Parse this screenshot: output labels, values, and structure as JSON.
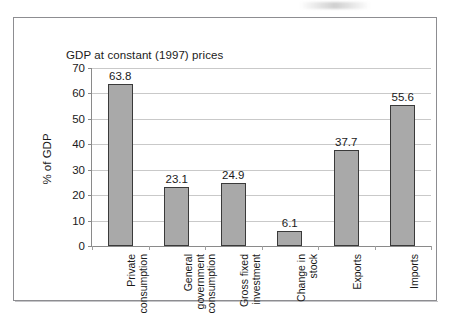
{
  "chart_data": {
    "type": "bar",
    "title": "GDP at constant (1997) prices",
    "xlabel": "",
    "ylabel": "% of GDP",
    "ylim": [
      0,
      70
    ],
    "ytick_step": 10,
    "yticks": [
      "70",
      "60",
      "50",
      "40",
      "30",
      "20",
      "10",
      "0"
    ],
    "grid": true,
    "legend": "none",
    "categories": [
      "Private\nconsumption",
      "General\ngovernment\nconsumption",
      "Gross fixed\ninvestment",
      "Change in\nstock",
      "Exports",
      "Imports"
    ],
    "values": [
      63.8,
      23.1,
      24.9,
      6.1,
      37.7,
      55.6
    ],
    "value_labels": [
      "63.8",
      "23.1",
      "24.9",
      "6.1",
      "37.7",
      "55.6"
    ],
    "bar_fill_color": "#a9a9a9",
    "bar_border_color": "#3a3a3a",
    "gridline_color": "#c9c9c9",
    "axis_color": "#8a8a8a"
  }
}
